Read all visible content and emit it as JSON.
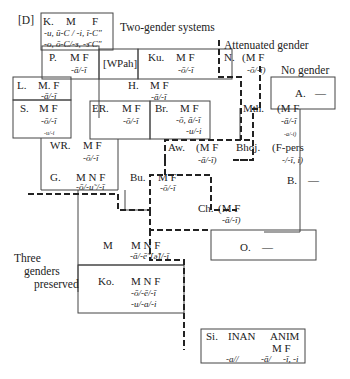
{
  "labels": {
    "d": "[D]",
    "two_gender": "Two-gender systems",
    "attenuated": "Attenuated gender",
    "no_gender": "No gender",
    "three_genders_1": "Three",
    "three_genders_2": "genders",
    "three_genders_3": "preserved"
  },
  "nodes": {
    "K": {
      "name": "K.",
      "g": "M",
      "g2": "F",
      "f1": "-u, ū-C / -i, ī-C\"",
      "f2": "-o, ō-C/-ɜ, -ɜ̄  C\""
    },
    "P": {
      "name": "P.",
      "g": "M F",
      "f1": "-ā/-ī"
    },
    "WPah": {
      "name": "[WPah]"
    },
    "Ku": {
      "name": "Ku.",
      "g": "M F",
      "f1": "-ō/-ī"
    },
    "N": {
      "name": "N.",
      "g": "(M F",
      "f1": "-ō/-ī)"
    },
    "L": {
      "name": "L.",
      "g": "M. F",
      "f1": "-ā/-ī"
    },
    "H": {
      "name": "H.",
      "g": "M F",
      "f1": "-ā/-ī"
    },
    "A": {
      "name": "A.",
      "g": "—"
    },
    "S": {
      "name": "S.",
      "g": "M F",
      "f1": "-ō/-ī",
      "f2": "-u/-i"
    },
    "ER": {
      "name": "ER.",
      "g": "M F",
      "f1": "-ō/-ī"
    },
    "Br": {
      "name": "Br.",
      "g": "M F",
      "f1": "-ō, ā/-ī",
      "f2": "-u/-i"
    },
    "Mth": {
      "name": "Mth.",
      "g": "(M F",
      "f1": "-ā/-ī",
      "f2": "-a/-i)"
    },
    "WR": {
      "name": "WR.",
      "g": "M F",
      "f1": "-ō/-ī"
    },
    "Aw": {
      "name": "Aw.",
      "g": "(M F",
      "f1": "-ā/-ī)"
    },
    "Bhoj": {
      "name": "Bhoj.",
      "g": "(F-pers",
      "f1": "-/-ī, i)"
    },
    "G": {
      "name": "G.",
      "g": "M N F",
      "f1": "-ō/-u˜/-ī"
    },
    "Bu": {
      "name": "Bu.",
      "g": "M F",
      "f1": "-ō/-ī"
    },
    "B": {
      "name": "B.",
      "g": "—"
    },
    "Ch": {
      "name": "Ch.",
      "g": "(M F",
      "f1": "-ā/-ī)"
    },
    "M": {
      "name": "M",
      "g": "M N F",
      "f1": "-ā/-ē˜[ə̃]/-ī"
    },
    "O": {
      "name": "O.",
      "g": "—"
    },
    "Ko": {
      "name": "Ko.",
      "g": "M N F",
      "f1": "-ō/-ē/-ī",
      "f2": "-u/-a/-i"
    },
    "Si": {
      "name": "Si.",
      "g": "INAN",
      "g2": "ANIM",
      "g3": "M  F",
      "f1": "-a//",
      "f2": "-ā/",
      "f3": "-ī, -i"
    }
  }
}
